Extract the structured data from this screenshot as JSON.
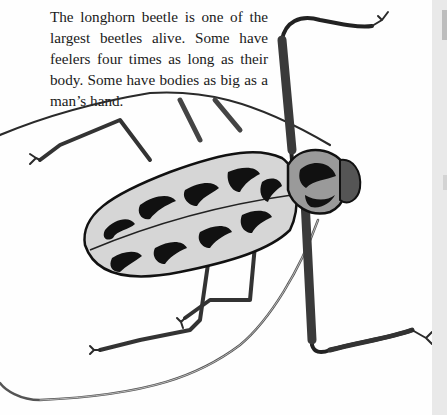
{
  "caption": {
    "text": "The longhorn beetle is one of the largest beetles alive. Some have feelers four times as long as their body. Some have bodies as big as a man’s hand."
  },
  "illustration": {
    "subject": "longhorn beetle",
    "style": "black-and-white ink illustration",
    "colors": {
      "ink": "#111111",
      "mid_gray": "#8a8a8a",
      "light_gray": "#cfcfcf",
      "paper": "#fefefe",
      "gutter": "#e9e9e9"
    }
  }
}
